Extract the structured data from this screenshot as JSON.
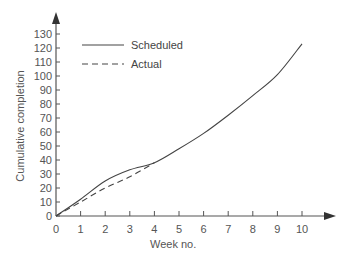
{
  "chart_data": {
    "type": "line",
    "title": "",
    "xlabel": "Week no.",
    "ylabel": "Cumulative completion",
    "x_ticks": [
      0,
      1,
      2,
      3,
      4,
      5,
      6,
      7,
      8,
      9,
      10
    ],
    "y_ticks": [
      0,
      10,
      20,
      30,
      40,
      50,
      60,
      70,
      80,
      90,
      100,
      110,
      120,
      130
    ],
    "xlim": [
      0,
      10
    ],
    "ylim": [
      0,
      130
    ],
    "grid": false,
    "legend_position": "upper-left",
    "series": [
      {
        "name": "Scheduled",
        "style": "solid",
        "x": [
          0,
          1,
          2,
          3,
          4,
          5,
          6,
          7,
          8,
          9,
          10
        ],
        "values": [
          0,
          12,
          25,
          33,
          38,
          48,
          59,
          72,
          86,
          101,
          123
        ]
      },
      {
        "name": "Actual",
        "style": "dashed",
        "x": [
          0,
          1,
          2,
          3,
          4
        ],
        "values": [
          0,
          10,
          20,
          28,
          38
        ]
      }
    ]
  },
  "colors": {
    "axis": "#555555",
    "line": "#444444",
    "text": "#555555"
  }
}
